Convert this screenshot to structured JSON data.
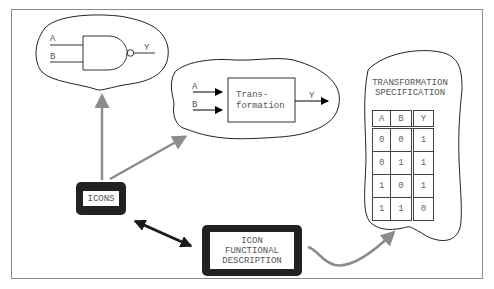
{
  "nand_gate": {
    "input_a": "A",
    "input_b": "B",
    "output": "Y"
  },
  "transformation_block": {
    "input_a": "A",
    "input_b": "B",
    "label_line1": "Trans-",
    "label_line2": "formation",
    "output": "Y"
  },
  "specification": {
    "title_line1": "TRANSFORMATION",
    "title_line2": "SPECIFICATION",
    "table": {
      "headers": [
        "A",
        "B",
        "Y"
      ],
      "rows": [
        [
          "0",
          "0",
          "1"
        ],
        [
          "0",
          "1",
          "1"
        ],
        [
          "1",
          "0",
          "1"
        ],
        [
          "1",
          "1",
          "0"
        ]
      ]
    }
  },
  "icons_box": {
    "label": "ICONS"
  },
  "description_box": {
    "line1": "ICON",
    "line2": "FUNCTIONAL",
    "line3": "DESCRIPTION"
  },
  "colors": {
    "frame": "#8a8a8a",
    "gray_arrow": "#8c8c8c",
    "black_arrow": "#1a1a1a",
    "box_fill": "#222222",
    "text": "#555555"
  }
}
